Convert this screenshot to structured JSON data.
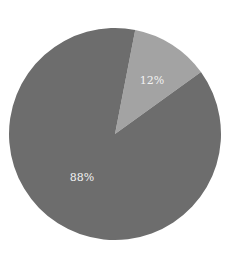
{
  "chart_data": {
    "type": "pie",
    "title": "",
    "categories": [
      "Slice A",
      "Slice B"
    ],
    "values": [
      12,
      88
    ],
    "labels": [
      "12%",
      "88%"
    ],
    "colors": [
      "#a3a3a3",
      "#6d6d6d"
    ],
    "start_angle_deg": 11,
    "legend": "none"
  },
  "labels": {
    "small": "12%",
    "large": "88%"
  }
}
